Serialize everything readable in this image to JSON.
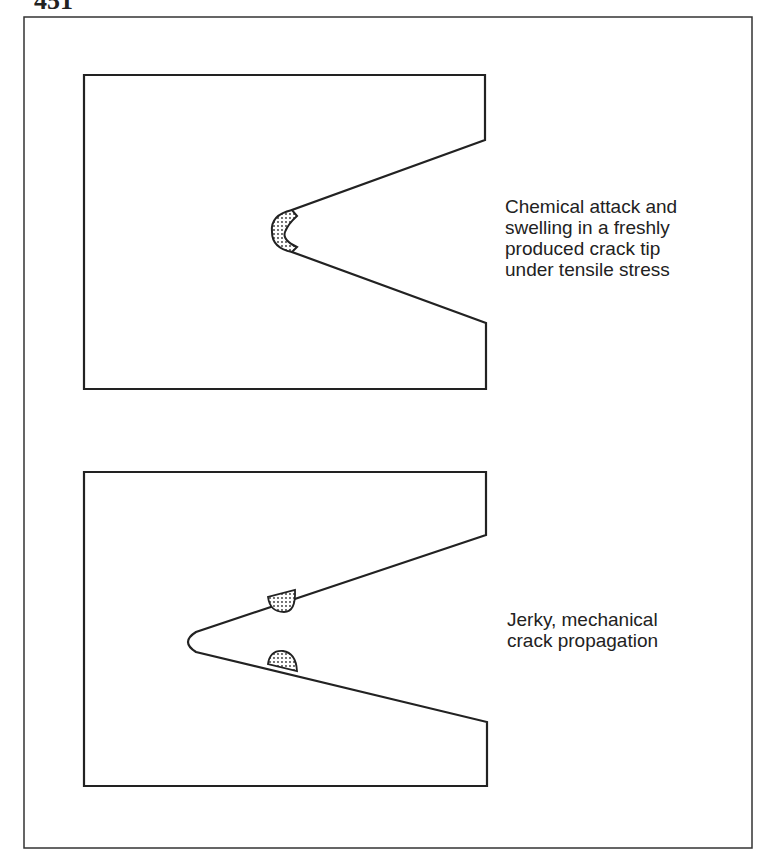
{
  "figure": {
    "number": "451",
    "panels": [
      {
        "id": "top",
        "caption_lines": [
          "Chemical attack and",
          "swelling in a freshly",
          "produced crack tip",
          "under tensile stress"
        ]
      },
      {
        "id": "bottom",
        "caption_lines": [
          "Jerky, mechanical",
          "crack propagation"
        ]
      }
    ]
  },
  "colors": {
    "line": "#222222",
    "background": "#ffffff"
  }
}
